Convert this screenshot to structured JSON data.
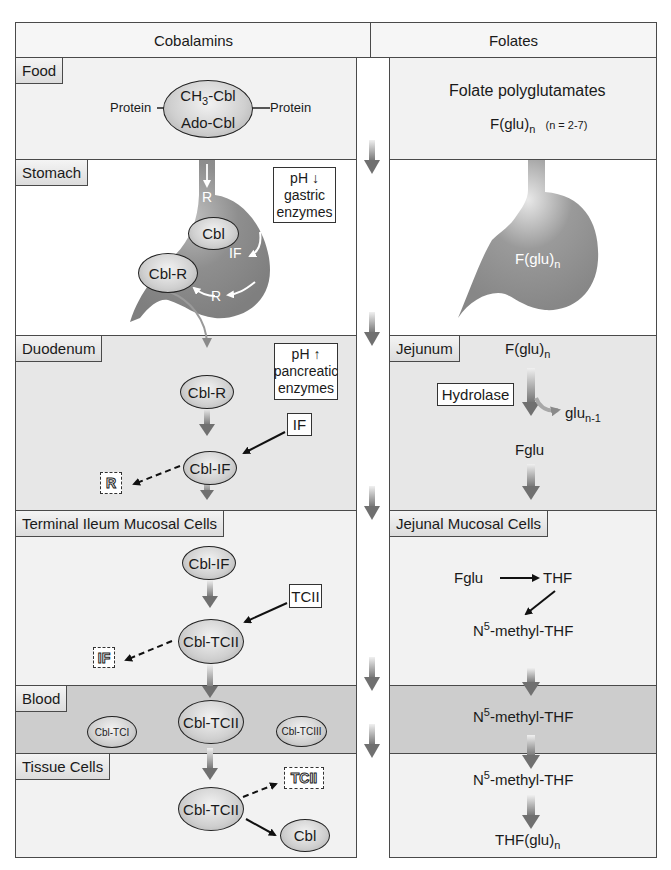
{
  "columns": {
    "left_title": "Cobalamins",
    "right_title": "Folates"
  },
  "rows": {
    "left": [
      "Food",
      "Stomach",
      "Duodenum",
      "Terminal Ileum Mucosal Cells",
      "Blood",
      "Tissue Cells"
    ],
    "right": [
      "Jejunum",
      "Jejunal Mucosal Cells"
    ]
  },
  "food": {
    "protein_left": "Protein",
    "protein_right": "Protein",
    "ellipse_top": "CH",
    "ellipse_top_sub": "3",
    "ellipse_top_suffix": "-Cbl",
    "ellipse_bottom": "Ado-Cbl",
    "folate_title": "Folate polyglutamates",
    "folate_formula": "F(glu)",
    "folate_sub": "n",
    "folate_note": "(n = 2-7)"
  },
  "stomach": {
    "r_top": "R",
    "cbl": "Cbl",
    "if_label": "IF",
    "r_bottom": "R",
    "cbl_r": "Cbl-R",
    "note_line1": "pH",
    "note_arrow": "↓",
    "note_line2": "gastric",
    "note_line3": "enzymes",
    "folate_formula": "F(glu)",
    "folate_sub": "n"
  },
  "duodenum": {
    "cbl_r": "Cbl-R",
    "note_line1": "pH",
    "note_arrow": "↑",
    "note_line2": "pancreatic",
    "note_line3": "enzymes",
    "if_box": "IF",
    "cbl_if": "Cbl-IF",
    "r_released": "R"
  },
  "jejunum": {
    "folate_formula": "F(glu)",
    "folate_sub": "n",
    "hydrolase": "Hydrolase",
    "glu_label": "glu",
    "glu_sub": "n-1",
    "fglu": "Fglu"
  },
  "ileum": {
    "cbl_if": "Cbl-IF",
    "tcii_box": "TCII",
    "cbl_tcii": "Cbl-TCII",
    "if_released": "IF"
  },
  "jejunal_cells": {
    "fglu": "Fglu",
    "thf": "THF",
    "n5": "N",
    "n5_sup": "5",
    "n5_suffix": "-methyl-THF"
  },
  "blood": {
    "cbl_tci": "Cbl-TCI",
    "cbl_tcii": "Cbl-TCII",
    "cbl_tciii": "Cbl-TCIII",
    "n5": "N",
    "n5_sup": "5",
    "n5_suffix": "-methyl-THF"
  },
  "tissue": {
    "cbl_tcii": "Cbl-TCII",
    "tcii_released": "TCII",
    "cbl": "Cbl",
    "n5": "N",
    "n5_sup": "5",
    "n5_suffix": "-methyl-THF",
    "thf_glu": "THF(glu)",
    "thf_glu_sub": "n"
  },
  "colors": {
    "organ_fill": "#8c8c8c",
    "panel_light": "#f2f2f2",
    "panel_mid": "#e7e7e7",
    "panel_blood": "#cdcdcd",
    "border": "#4a4a4a"
  }
}
